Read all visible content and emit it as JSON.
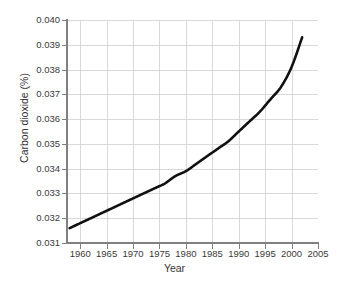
{
  "chart_data": {
    "type": "line",
    "title": "",
    "xlabel": "Year",
    "ylabel": "Carbon dioxide (%)",
    "xlim": [
      1957.5,
      2005
    ],
    "ylim": [
      0.031,
      0.04
    ],
    "xticks": [
      1960,
      1965,
      1970,
      1975,
      1980,
      1985,
      1990,
      1995,
      2000,
      2005
    ],
    "xtick_labels": [
      "1960",
      "1965",
      "1970",
      "1975",
      "1980",
      "1985",
      "1990",
      "1995",
      "2000",
      "2005"
    ],
    "yticks": [
      0.031,
      0.032,
      0.033,
      0.034,
      0.035,
      0.036,
      0.037,
      0.038,
      0.039,
      0.04
    ],
    "ytick_labels": [
      "0.031",
      "0.032",
      "0.033",
      "0.034",
      "0.035",
      "0.036",
      "0.037",
      "0.038",
      "0.039",
      "0.040"
    ],
    "grid": true,
    "legend": "none",
    "series": [
      {
        "name": "Carbon dioxide",
        "color": "#111111",
        "x": [
          1958,
          1960,
          1962,
          1964,
          1966,
          1968,
          1970,
          1972,
          1974,
          1976,
          1978,
          1980,
          1982,
          1984,
          1986,
          1988,
          1990,
          1992,
          1994,
          1996,
          1998,
          2000,
          2002
        ],
        "values": [
          0.0316,
          0.0318,
          0.032,
          0.0322,
          0.0324,
          0.0326,
          0.0328,
          0.033,
          0.0332,
          0.0334,
          0.0337,
          0.0339,
          0.0342,
          0.0345,
          0.0348,
          0.0351,
          0.0355,
          0.0359,
          0.0363,
          0.0368,
          0.0373,
          0.0381,
          0.0393
        ]
      }
    ]
  },
  "colors": {
    "curve": "#111111",
    "grid": "#d9d9d9",
    "axis": "#808080",
    "text": "#3a3a3a",
    "background": "#ffffff"
  }
}
